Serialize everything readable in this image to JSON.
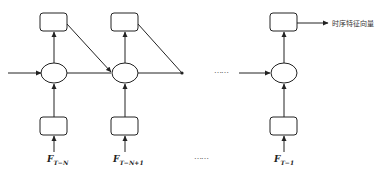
{
  "diagram": {
    "type": "rnn-unrolled",
    "output_label": "时序特征向量",
    "ellipsis": "……",
    "columns": [
      {
        "input_label_main": "F",
        "input_label_sub": "T−N"
      },
      {
        "input_label_main": "F",
        "input_label_sub": "T−N+1"
      },
      {
        "input_label_main": "F",
        "input_label_sub": "T−1"
      }
    ],
    "colors": {
      "stroke": "#222222",
      "background": "#ffffff"
    }
  }
}
